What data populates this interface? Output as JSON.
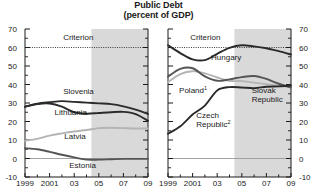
{
  "title": {
    "main": "Public Debt",
    "sub": "(percent of GDP)"
  },
  "colors": {
    "line_dark": "#2b2b2b",
    "line_mid": "#6d6d6d",
    "line_light": "#b4b4b4",
    "criterion": "#3a3a3a",
    "shade": "#d9d9d9",
    "axis": "#1a1a1a",
    "zero_line": "#9a9a9a",
    "background": "#ffffff"
  },
  "axes": {
    "y_ticks": [
      "70",
      "60",
      "50",
      "40",
      "30",
      "20",
      "10",
      "0",
      "-10"
    ],
    "y_values": [
      70,
      60,
      50,
      40,
      30,
      20,
      10,
      0,
      -10
    ],
    "y_min": -10,
    "y_max": 70,
    "x_ticks": [
      "1999",
      "2001",
      "03",
      "05",
      "07",
      "09"
    ],
    "x_tick_values": [
      1999,
      2001,
      2003,
      2005,
      2007,
      2009
    ],
    "x_min": 1999,
    "x_max": 2009,
    "criterion_value": 60,
    "criterion_label": "Criterion",
    "shade_start": 2004.4,
    "shade_end": 2009
  },
  "chart_data": {
    "type": "line",
    "title": "Public Debt (percent of GDP)",
    "xlabel": "",
    "ylabel": "",
    "ylim": [
      -10,
      70
    ],
    "xlim": [
      1999,
      2009
    ],
    "grid": false,
    "legend": "inline-labels",
    "annotations": [
      "Criterion line at 60 percent of GDP (dotted)",
      "Shaded area from mid-2004 onward denotes projections"
    ],
    "panels": [
      {
        "name": "left-panel",
        "x": [
          1999,
          2000,
          2001,
          2002,
          2003,
          2004,
          2005,
          2006,
          2007,
          2008,
          2009
        ],
        "series": [
          {
            "name": "Slovenia",
            "color": "#2b2b2b",
            "values": [
              28.0,
              29.6,
              30.4,
              31.0,
              30.6,
              30.2,
              29.8,
              29.4,
              28.2,
              26.4,
              24.0
            ]
          },
          {
            "name": "Lithuania",
            "color": "#2b2b2b",
            "values": [
              28.0,
              29.4,
              29.7,
              28.0,
              25.0,
              24.2,
              24.6,
              25.0,
              25.2,
              24.0,
              20.4
            ]
          },
          {
            "name": "Latvia",
            "color": "#b4b4b4",
            "values": [
              9.6,
              10.6,
              12.4,
              13.6,
              14.6,
              15.4,
              16.4,
              16.6,
              16.4,
              16.2,
              16.2
            ]
          },
          {
            "name": "Estonia",
            "color": "#555555",
            "values": [
              5.6,
              5.0,
              3.6,
              2.0,
              0.6,
              -0.6,
              -0.6,
              -0.4,
              -0.2,
              -0.2,
              -0.2
            ]
          }
        ],
        "labels": [
          {
            "text": "Criterion",
            "x": 2002.1,
            "y": 64.0
          },
          {
            "text": "Slovenia",
            "x": 2002.1,
            "y": 35.0
          },
          {
            "text": "Lithuania",
            "x": 2001.4,
            "y": 23.4
          },
          {
            "text": "Latvia",
            "x": 2002.2,
            "y": 10.6
          },
          {
            "text": "Estonia",
            "x": 2002.6,
            "y": -5.4
          }
        ]
      },
      {
        "name": "right-panel",
        "x": [
          1999,
          2000,
          2001,
          2002,
          2003,
          2004,
          2005,
          2006,
          2007,
          2008,
          2009
        ],
        "series": [
          {
            "name": "Hungary",
            "color": "#2b2b2b",
            "values": [
              61.2,
              57.0,
              53.6,
              53.2,
              56.6,
              59.8,
              61.2,
              60.6,
              59.6,
              58.0,
              56.2
            ]
          },
          {
            "name": "Poland",
            "superscript": "1",
            "color": "#b4b4b4",
            "values": [
              41.2,
              45.6,
              47.2,
              46.0,
              43.8,
              42.0,
              41.8,
              41.0,
              40.2,
              39.4,
              38.6
            ]
          },
          {
            "name": "Slovak Republic",
            "color": "#555555",
            "values": [
              44.2,
              48.4,
              48.8,
              44.4,
              42.0,
              42.8,
              44.0,
              44.6,
              43.0,
              40.4,
              38.4
            ]
          },
          {
            "name": "Czech Republic",
            "superscript": "2",
            "color": "#2b2b2b",
            "values": [
              13.4,
              17.4,
              23.8,
              28.6,
              36.8,
              38.6,
              38.4,
              38.0,
              38.8,
              39.0,
              39.4
            ]
          }
        ],
        "labels": [
          {
            "text": "Criterion",
            "x": 2000.8,
            "y": 64.2
          },
          {
            "text": "Hungary",
            "x": 2002.5,
            "y": 53.0
          },
          {
            "text": "Poland",
            "superscript": "1",
            "x": 1999.9,
            "y": 35.2
          },
          {
            "text": "Czech Republic",
            "superscript": "2",
            "x": 2001.3,
            "y": 22.0
          },
          {
            "text": "Slovak Republic",
            "x": 2005.8,
            "y": 35.5
          }
        ]
      }
    ]
  }
}
